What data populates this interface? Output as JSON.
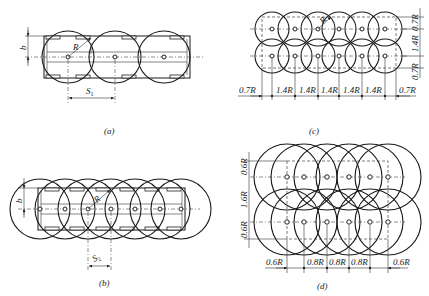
{
  "figure": {
    "panels": [
      {
        "id": "a",
        "caption": "(a)",
        "arrangement": "single row",
        "circle_count": 3,
        "labels": {
          "radius": "R",
          "spacing": "S",
          "spacing_sub": "1",
          "width": "b"
        }
      },
      {
        "id": "b",
        "caption": "(b)",
        "arrangement": "single row, dense",
        "circle_count": 7,
        "labels": {
          "radius": "R",
          "spacing": "S",
          "spacing_sub": "2",
          "width": "b"
        }
      },
      {
        "id": "c",
        "caption": "(c)",
        "arrangement": "two rows",
        "circle_count": 12,
        "labels": {
          "radius": "R",
          "bottom_dims": [
            "0.7R",
            "1.4R",
            "1.4R",
            "1.4R",
            "1.4R",
            "1.4R",
            "0.7R"
          ],
          "side_dims": [
            "0.7R",
            "1.4R",
            "0.7R"
          ]
        }
      },
      {
        "id": "d",
        "caption": "(d)",
        "arrangement": "two rows, dense",
        "circle_count": 12,
        "labels": {
          "bottom_dims": [
            "0.6R",
            "0.8R",
            "0.8R",
            "0.8R",
            "0.6R"
          ],
          "side_dims": [
            "0.6R",
            "1.6R",
            "0.6R"
          ]
        }
      }
    ]
  },
  "colors": {
    "line": "#1a1a1a",
    "background": "#ffffff"
  }
}
